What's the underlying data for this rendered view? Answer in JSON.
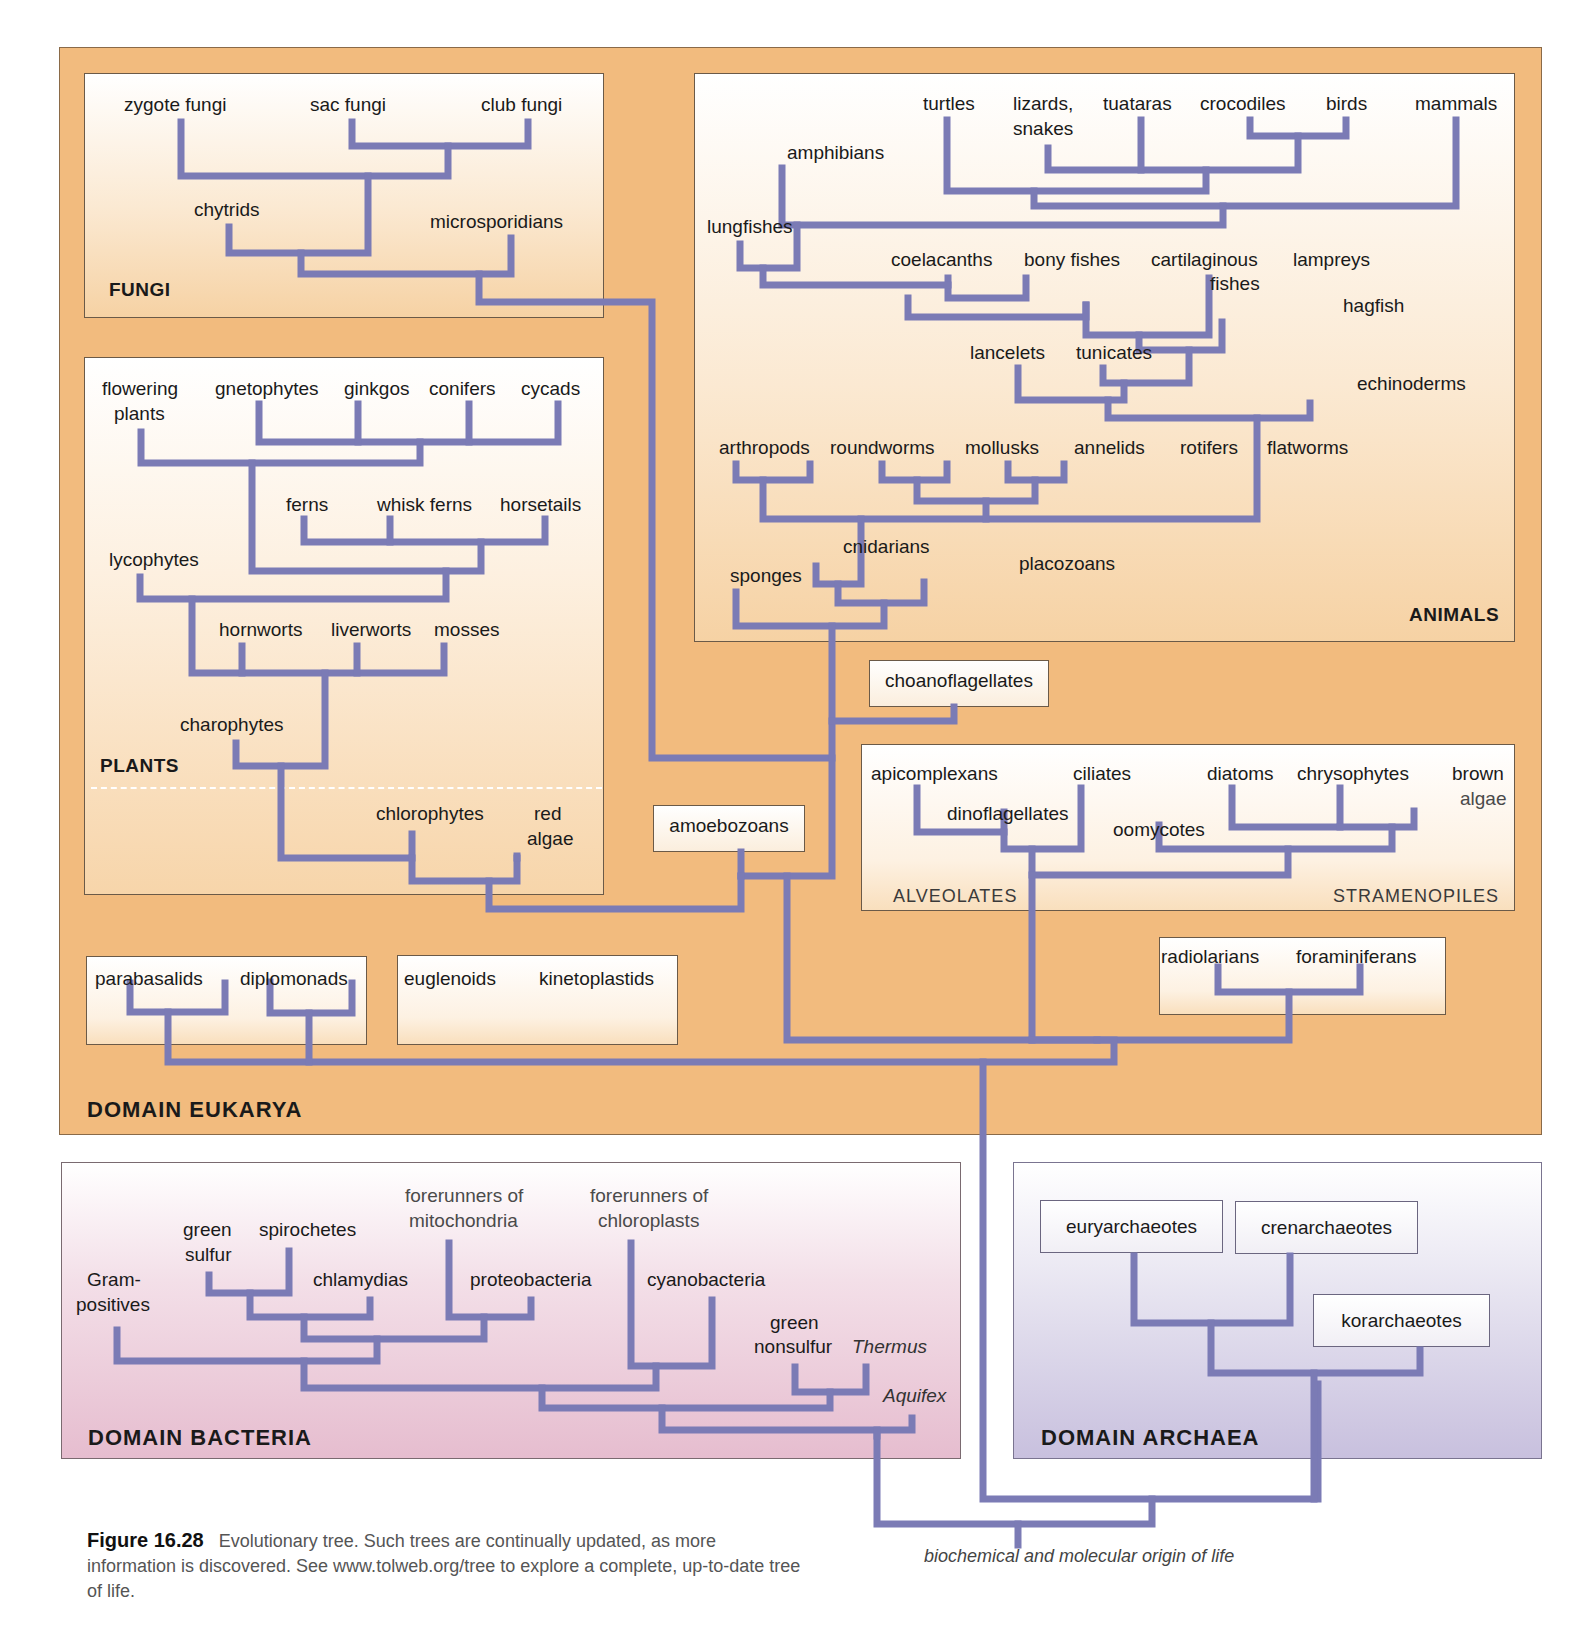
{
  "figure": {
    "number_label": "Figure 16.28",
    "caption_text": "Evolutionary tree. Such trees are continually updated, as more information is discovered. See www.tolweb.org/tree to explore a complete, up-to-date tree of life.",
    "root_label": "biochemical and molecular origin of life",
    "branch_color": "#7b7bb5"
  },
  "domains": {
    "eukarya": "DOMAIN EUKARYA",
    "bacteria": "DOMAIN BACTERIA",
    "archaea": "DOMAIN ARCHAEA"
  },
  "groups": {
    "fungi": {
      "title": "FUNGI",
      "taxa": [
        "zygote fungi",
        "sac fungi",
        "club fungi",
        "chytrids",
        "microsporidians"
      ]
    },
    "animals": {
      "title": "ANIMALS",
      "taxa": [
        "turtles",
        "lizards, snakes",
        "tuataras",
        "crocodiles",
        "birds",
        "mammals",
        "amphibians",
        "lungfishes",
        "coelacanths",
        "bony fishes",
        "cartilaginous fishes",
        "lampreys",
        "hagfish",
        "lancelets",
        "tunicates",
        "echinoderms",
        "arthropods",
        "roundworms",
        "mollusks",
        "annelids",
        "rotifers",
        "flatworms",
        "cnidarians",
        "placozoans",
        "sponges"
      ]
    },
    "plants": {
      "title": "PLANTS",
      "taxa": [
        "flowering plants",
        "gnetophytes",
        "ginkgos",
        "conifers",
        "cycads",
        "ferns",
        "whisk ferns",
        "horsetails",
        "lycophytes",
        "hornworts",
        "liverworts",
        "mosses",
        "charophytes",
        "chlorophytes",
        "red algae"
      ]
    },
    "protists": {
      "taxa": [
        "choanoflagellates",
        "amoebozoans",
        "parabasalids",
        "diplomonads",
        "euglenoids",
        "kinetoplastids",
        "radiolarians",
        "foraminiferans"
      ]
    },
    "alveolates": {
      "title": "ALVEOLATES",
      "taxa": [
        "apicomplexans",
        "dinoflagellates",
        "ciliates"
      ]
    },
    "stramenopiles": {
      "title": "STRAMENOPILES",
      "taxa": [
        "oomycotes",
        "diatoms",
        "chrysophytes",
        "brown algae"
      ]
    },
    "bacteria": {
      "taxa": [
        "Gram-positives",
        "green sulfur",
        "spirochetes",
        "chlamydias",
        "forerunners of mitochondria",
        "proteobacteria",
        "forerunners of chloroplasts",
        "cyanobacteria",
        "green nonsulfur",
        "Thermus",
        "Aquifex"
      ]
    },
    "archaea": {
      "taxa": [
        "euryarchaeotes",
        "crenarchaeotes",
        "korarchaeotes"
      ]
    }
  },
  "labels": {
    "zygote_fungi": "zygote fungi",
    "sac_fungi": "sac fungi",
    "club_fungi": "club fungi",
    "chytrids": "chytrids",
    "microsporidians": "microsporidians",
    "turtles": "turtles",
    "lizards": "lizards,",
    "snakes": "snakes",
    "tuataras": "tuataras",
    "crocodiles": "crocodiles",
    "birds": "birds",
    "mammals": "mammals",
    "amphibians": "amphibians",
    "lungfishes": "lungfishes",
    "coelacanths": "coelacanths",
    "bony_fishes": "bony fishes",
    "cartilaginous": "cartilaginous",
    "fishes": "fishes",
    "lampreys": "lampreys",
    "hagfish": "hagfish",
    "lancelets": "lancelets",
    "tunicates": "tunicates",
    "echinoderms": "echinoderms",
    "arthropods": "arthropods",
    "roundworms": "roundworms",
    "mollusks": "mollusks",
    "annelids": "annelids",
    "rotifers": "rotifers",
    "flatworms": "flatworms",
    "cnidarians": "cnidarians",
    "placozoans": "placozoans",
    "sponges": "sponges",
    "flowering": "flowering",
    "plants_word": "plants",
    "gnetophytes": "gnetophytes",
    "ginkgos": "ginkgos",
    "conifers": "conifers",
    "cycads": "cycads",
    "ferns": "ferns",
    "whisk_ferns": "whisk ferns",
    "horsetails": "horsetails",
    "lycophytes": "lycophytes",
    "hornworts": "hornworts",
    "liverworts": "liverworts",
    "mosses": "mosses",
    "charophytes": "charophytes",
    "chlorophytes": "chlorophytes",
    "red": "red",
    "algae": "algae",
    "choanoflagellates": "choanoflagellates",
    "amoebozoans": "amoebozoans",
    "apicomplexans": "apicomplexans",
    "dinoflagellates": "dinoflagellates",
    "ciliates": "ciliates",
    "oomycotes": "oomycotes",
    "diatoms": "diatoms",
    "chrysophytes": "chrysophytes",
    "brown": "brown",
    "brown_algae": "algae",
    "radiolarians": "radiolarians",
    "foraminiferans": "foraminiferans",
    "parabasalids": "parabasalids",
    "diplomonads": "diplomonads",
    "euglenoids": "euglenoids",
    "kinetoplastids": "kinetoplastids",
    "gram": "Gram-",
    "positives": "positives",
    "green": "green",
    "sulfur": "sulfur",
    "spirochetes": "spirochetes",
    "chlamydias": "chlamydias",
    "forerunners_of": "forerunners of",
    "mitochondria": "mitochondria",
    "proteobacteria": "proteobacteria",
    "chloroplasts": "chloroplasts",
    "cyanobacteria": "cyanobacteria",
    "green2": "green",
    "nonsulfur": "nonsulfur",
    "thermus": "Thermus",
    "aquifex": "Aquifex",
    "euryarchaeotes": "euryarchaeotes",
    "crenarchaeotes": "crenarchaeotes",
    "korarchaeotes": "korarchaeotes"
  }
}
